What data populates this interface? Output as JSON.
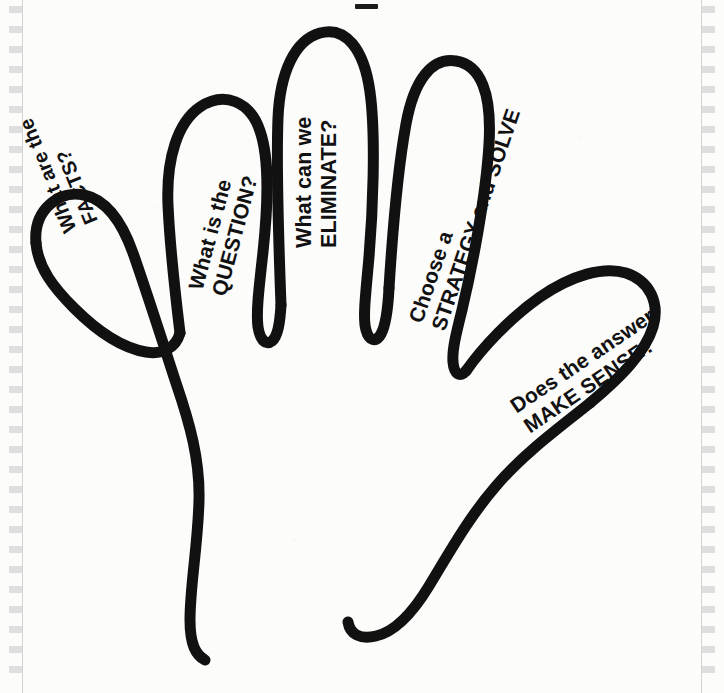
{
  "poster": {
    "title": "Problem Solving Hand",
    "description": "Hand-drawn outline of an open left hand with a problem-solving step written on each finger",
    "background_color": "#fcfcfb",
    "ink_color": "#111111",
    "stroke_width": 11
  },
  "top_mark": {
    "name": "scan-registration-mark",
    "color": "#1b1b1b"
  },
  "rulers": {
    "left": {
      "label": "",
      "tick_color": "#6e6e73"
    },
    "right": {
      "label": "",
      "tick_color": "#6e6e73"
    }
  },
  "hand": {
    "fingers": [
      {
        "id": "thumb",
        "name": "thumb",
        "step": 1,
        "line1": "What are the",
        "line2": "FACTS?",
        "rotation_deg": 248
      },
      {
        "id": "index",
        "name": "index-finger",
        "step": 2,
        "line1": "What is the",
        "line2": "QUESTION?",
        "rotation_deg": -75
      },
      {
        "id": "middle",
        "name": "middle-finger",
        "step": 3,
        "line1": "What can we",
        "line2": "ELIMINATE?",
        "rotation_deg": -90
      },
      {
        "id": "ring",
        "name": "ring-finger",
        "step": 4,
        "line1": "Choose a",
        "line2": "STRATEGY and SOLVE",
        "rotation_deg": -71
      },
      {
        "id": "pinky",
        "name": "little-finger",
        "step": 5,
        "line1": "Does the answer",
        "line2": "MAKE SENSE?",
        "rotation_deg": -34
      }
    ]
  }
}
